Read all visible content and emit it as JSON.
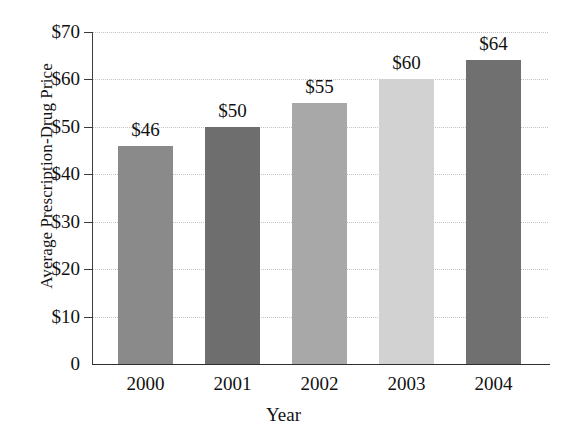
{
  "chart_data": {
    "type": "bar",
    "title": "",
    "xlabel": "Year",
    "ylabel": "Average Prescription-Drug Price",
    "categories": [
      "2000",
      "2001",
      "2002",
      "2003",
      "2004"
    ],
    "values": [
      46,
      50,
      55,
      60,
      64
    ],
    "value_labels": [
      "$46",
      "$50",
      "$55",
      "$60",
      "$64"
    ],
    "ylim": [
      0,
      70
    ],
    "ytick_values": [
      0,
      10,
      20,
      30,
      40,
      50,
      60,
      70
    ],
    "ytick_labels": [
      "0",
      "$10",
      "$20",
      "$30",
      "$40",
      "$50",
      "$60",
      "$70"
    ],
    "grid": true,
    "grid_axis": "y",
    "legend": false,
    "bar_colors": [
      "#8a8a8a",
      "#6e6e6e",
      "#a8a8a8",
      "#d2d2d2",
      "#707070"
    ]
  },
  "axes": {
    "y_title": "Average Prescription-Drug Price",
    "x_title": "Year"
  },
  "colors": {
    "axis": "#2e2e2e",
    "gridline": "#c4c4c4",
    "text": "#111111",
    "background": "#ffffff"
  }
}
